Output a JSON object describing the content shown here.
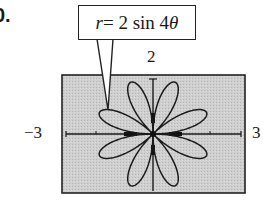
{
  "problem": {
    "number_fragment": "0."
  },
  "callout": {
    "var": "r",
    "rest": " = 2 sin 4",
    "theta": "θ"
  },
  "chart_data": {
    "type": "line",
    "title": "r = 2 sin 4θ",
    "equation": "r = 2 sin 4θ",
    "window": {
      "xmin": -3,
      "xmax": 3,
      "ymin": -2,
      "ymax": 2
    },
    "tick_labels": {
      "xmin": "−3",
      "xmax": "3",
      "ymax": "2"
    },
    "petals": 8,
    "max_radius": 2,
    "petal_tip_angles_deg": [
      22.5,
      67.5,
      112.5,
      157.5,
      202.5,
      247.5,
      292.5,
      337.5
    ],
    "grid": false,
    "background": "#c8c8c8"
  },
  "labels": {
    "ymax": "2",
    "xmin": "−3",
    "xmax": "3"
  }
}
